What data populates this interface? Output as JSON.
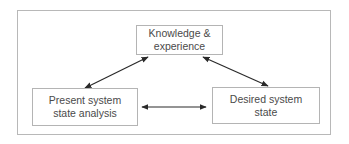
{
  "diagram": {
    "type": "triangular relationship diagram",
    "nodes": [
      {
        "id": "knowledge",
        "label_lines": [
          "Knowledge &",
          "experience"
        ]
      },
      {
        "id": "present",
        "label_lines": [
          "Present system",
          "state analysis"
        ]
      },
      {
        "id": "desired",
        "label_lines": [
          "Desired system",
          "state"
        ]
      }
    ],
    "edges": [
      {
        "from": "knowledge",
        "to": "present",
        "direction": "bidirectional"
      },
      {
        "from": "knowledge",
        "to": "desired",
        "direction": "bidirectional"
      },
      {
        "from": "present",
        "to": "desired",
        "direction": "bidirectional"
      }
    ],
    "colors": {
      "border": "#b4b4b4",
      "text": "#4a4a4a",
      "arrow": "#2a2a2a"
    }
  }
}
